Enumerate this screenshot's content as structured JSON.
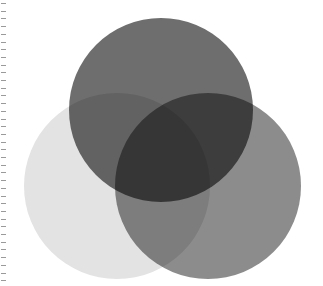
{
  "diagram": {
    "type": "venn",
    "sets": [
      {
        "id": "top",
        "color": "#6e6e6e",
        "cx": 161,
        "cy": 110,
        "r": 92,
        "label": ""
      },
      {
        "id": "left",
        "color": "#e3e3e3",
        "cx": 117,
        "cy": 186,
        "r": 93,
        "label": ""
      },
      {
        "id": "right",
        "color": "#8c8c8c",
        "cx": 208,
        "cy": 186,
        "r": 93,
        "label": ""
      }
    ],
    "ticks": {
      "count": 37,
      "spacing": 7.7,
      "start": 3,
      "color": "#9a9a9a"
    }
  }
}
